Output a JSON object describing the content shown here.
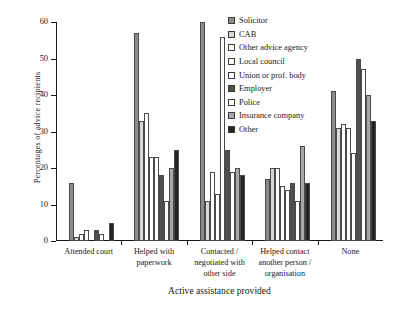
{
  "chart_data": {
    "type": "bar",
    "title": "",
    "xlabel": "Active assistance provided",
    "ylabel": "Percentages of advice recipients",
    "ylim": [
      0,
      60
    ],
    "yticks": [
      0,
      10,
      20,
      30,
      40,
      50,
      60
    ],
    "grid": false,
    "legend_position": "top-right-inside",
    "categories": [
      "Attended court",
      "Helped with\npaperwork",
      "Contacted /\nnegotiated with\nother side",
      "Helped contact\nanother person /\norganisation",
      "None"
    ],
    "series": [
      {
        "name": "Solicitor",
        "color": "#8c8c8c",
        "values": [
          16,
          57,
          60,
          17,
          41
        ]
      },
      {
        "name": "CAB",
        "color": "#d8d8d8",
        "values": [
          1,
          33,
          11,
          20,
          31
        ]
      },
      {
        "name": "Other advice agency",
        "color": "#ffffff",
        "values": [
          2,
          35,
          19,
          20,
          32
        ]
      },
      {
        "name": "Local council",
        "color": "#ffffff",
        "values": [
          3,
          23,
          13,
          15,
          31
        ]
      },
      {
        "name": "Union or prof. body",
        "color": "#ffffff",
        "values": [
          0,
          23,
          56,
          14,
          24
        ]
      },
      {
        "name": "Employer",
        "color": "#4f4f4f",
        "values": [
          3,
          18,
          25,
          16,
          50
        ]
      },
      {
        "name": "Police",
        "color": "#ffffff",
        "values": [
          2,
          11,
          19,
          11,
          47
        ]
      },
      {
        "name": "Insurance company",
        "color": "#a8a8a8",
        "values": [
          0,
          20,
          20,
          26,
          40
        ]
      },
      {
        "name": "Other",
        "color": "#232323",
        "values": [
          5,
          25,
          18,
          16,
          33
        ]
      }
    ]
  },
  "legend": {
    "items": [
      {
        "label": "Solicitor"
      },
      {
        "label": "CAB"
      },
      {
        "label": "Other advice agency"
      },
      {
        "label": "Local council"
      },
      {
        "label": "Union or prof. body"
      },
      {
        "label": "Employer"
      },
      {
        "label": "Police"
      },
      {
        "label": "Insurance company"
      },
      {
        "label": "Other"
      }
    ]
  },
  "axes": {
    "y_title": "Percentages of advice recipients",
    "x_title": "Active assistance provided",
    "y_tick_labels": [
      "0",
      "10",
      "20",
      "30",
      "40",
      "50",
      "60"
    ]
  }
}
